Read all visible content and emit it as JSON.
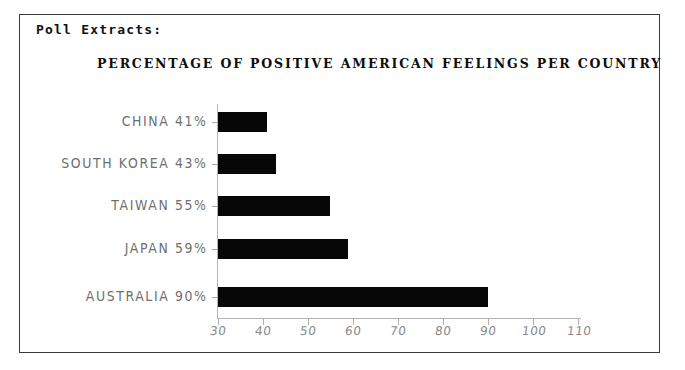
{
  "document": {
    "extract_title": "Poll Extracts:"
  },
  "chart_data": {
    "type": "bar",
    "orientation": "horizontal",
    "title": "PERCENTAGE OF POSITIVE AMERICAN FEELINGS PER COUNTRY",
    "xlabel": "",
    "ylabel": "",
    "categories": [
      "CHINA",
      "SOUTH KOREA",
      "TAIWAN",
      "JAPAN",
      "AUSTRALIA"
    ],
    "values": [
      41,
      43,
      55,
      59,
      90
    ],
    "category_labels": [
      "CHINA 41%",
      "SOUTH KOREA 43%",
      "TAIWAN 55%",
      "JAPAN 59%",
      "AUSTRALIA 90%"
    ],
    "xlim": [
      30,
      110
    ],
    "xticks": [
      30,
      40,
      50,
      60,
      70,
      80,
      90,
      100,
      110
    ],
    "xtick_labels": [
      "30",
      "40",
      "50",
      "60",
      "70",
      "80",
      "90",
      "100",
      "110"
    ],
    "grid": false,
    "legend": false,
    "bar_color": "#070707",
    "axis_color": "#b4b4b4",
    "label_color": "#6f6f6f",
    "title_color": "#0d0d0d"
  }
}
